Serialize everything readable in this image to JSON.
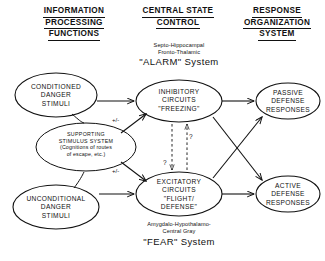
{
  "figure": {
    "background": "#ffffff",
    "ink": "#111111"
  },
  "columns": [
    {
      "id": "information-processing",
      "lines": [
        "INFORMATION",
        "PROCESSING",
        "FUNCTIONS"
      ]
    },
    {
      "id": "central-state-control",
      "lines": [
        "CENTRAL STATE",
        "CONTROL"
      ]
    },
    {
      "id": "response-organization",
      "lines": [
        "RESPONSE",
        "ORGANIZATION",
        "SYSTEM"
      ]
    }
  ],
  "nodes": {
    "conditioned": {
      "lines": [
        "CONDITIONED",
        "DANGER",
        "STIMULI"
      ]
    },
    "unconditional": {
      "lines": [
        "UNCONDITIONAL",
        "DANGER",
        "STIMULI"
      ]
    },
    "supporting": {
      "lines": [
        "SUPPORTING",
        "STIMULUS SYSTEM",
        "(Cognitions of routes",
        "of escape, etc.)"
      ]
    },
    "inhibitory": {
      "lines": [
        "INHIBITORY",
        "CIRCUITS",
        "\"FREEZING\""
      ]
    },
    "excitatory": {
      "lines": [
        "EXCITATORY",
        "CIRCUITS",
        "\"FLIGHT/",
        "DEFENSE\""
      ]
    },
    "passive": {
      "lines": [
        "PASSIVE",
        "DEFENSE",
        "RESPONSES"
      ]
    },
    "active": {
      "lines": [
        "ACTIVE",
        "DEFENSE",
        "RESPONSES"
      ]
    }
  },
  "annotations": {
    "alarm_sub": [
      "Septo-Hippocampal",
      "Fronto-Thalamic"
    ],
    "alarm_name": "\"ALARM\" System",
    "fear_sub": [
      "Amygdalo-Hypothalamo-",
      "Central Gray"
    ],
    "fear_name": "\"FEAR\" System",
    "sign_upper": "+/-",
    "sign_lower": "+/-",
    "question_upper": "?",
    "question_lower": "?"
  }
}
